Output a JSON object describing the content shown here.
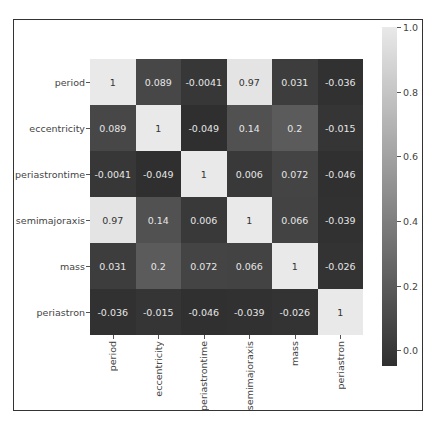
{
  "chart_data": {
    "type": "heatmap",
    "title": "",
    "xlabel": "",
    "ylabel": "",
    "rows": [
      "period",
      "eccentricity",
      "periastrontime",
      "semimajoraxis",
      "mass",
      "periastron"
    ],
    "columns": [
      "period",
      "eccentricity",
      "periastrontime",
      "semimajoraxis",
      "mass",
      "periastron"
    ],
    "values": [
      [
        1,
        0.089,
        -0.0041,
        0.97,
        0.031,
        -0.036
      ],
      [
        0.089,
        1,
        -0.049,
        0.14,
        0.2,
        -0.015
      ],
      [
        -0.0041,
        -0.049,
        1,
        0.006,
        0.072,
        -0.046
      ],
      [
        0.97,
        0.14,
        0.006,
        1,
        0.066,
        -0.039
      ],
      [
        0.031,
        0.2,
        0.072,
        0.066,
        1,
        -0.026
      ],
      [
        -0.036,
        -0.015,
        -0.046,
        -0.039,
        -0.026,
        1
      ]
    ],
    "labels": [
      [
        "1",
        "0.089",
        "-0.0041",
        "0.97",
        "0.031",
        "-0.036"
      ],
      [
        "0.089",
        "1",
        "-0.049",
        "0.14",
        "0.2",
        "-0.015"
      ],
      [
        "-0.0041",
        "-0.049",
        "1",
        "0.006",
        "0.072",
        "-0.046"
      ],
      [
        "0.97",
        "0.14",
        "0.006",
        "1",
        "0.066",
        "-0.039"
      ],
      [
        "0.031",
        "0.2",
        "0.072",
        "0.066",
        "1",
        "-0.026"
      ],
      [
        "-0.036",
        "-0.015",
        "-0.046",
        "-0.039",
        "-0.026",
        "1"
      ]
    ],
    "colorbar": {
      "ticks": [
        "1.0",
        "0.8",
        "0.6",
        "0.4",
        "0.2",
        "0.0"
      ],
      "tick_values": [
        1.0,
        0.8,
        0.6,
        0.4,
        0.2,
        0.0
      ],
      "vmin": -0.049,
      "vmax": 1.0,
      "colormap": "gray",
      "low_color": "#2f2f2f",
      "high_color": "#e9e9e9"
    },
    "annot": true
  }
}
